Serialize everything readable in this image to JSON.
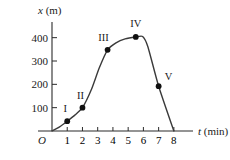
{
  "chart_data": {
    "type": "line",
    "title": "",
    "xlabel": "t (min)",
    "ylabel": "x (m)",
    "xlabel_var": "t",
    "xlabel_unit": "(min)",
    "ylabel_var": "x",
    "ylabel_unit": "(m)",
    "origin_label": "O",
    "grid": false,
    "legend": "none",
    "xlim": [
      0,
      8.6
    ],
    "ylim": [
      0,
      450
    ],
    "xticks": [
      1,
      2,
      3,
      4,
      5,
      6,
      7,
      8
    ],
    "xticklabels": [
      "1",
      "2",
      "3",
      "4",
      "5",
      "6",
      "7",
      "8"
    ],
    "yticks": [
      100,
      200,
      300,
      400
    ],
    "yticklabels": [
      "100",
      "200",
      "300",
      "400"
    ],
    "series": [
      {
        "name": "position",
        "x": [
          0,
          0.5,
          1,
          1.5,
          2,
          2.6,
          3.1,
          3.65,
          4.2,
          4.8,
          5.5,
          5.95,
          6.3,
          7,
          8
        ],
        "y": [
          0,
          18,
          42,
          68,
          100,
          180,
          270,
          348,
          378,
          395,
          403,
          405,
          360,
          192,
          0
        ]
      }
    ],
    "points": [
      {
        "label": "I",
        "t": 1,
        "x": 42,
        "label_dx": -2,
        "label_dy": -9
      },
      {
        "label": "II",
        "t": 2,
        "x": 100,
        "label_dx": -2,
        "label_dy": -9
      },
      {
        "label": "III",
        "t": 3.65,
        "x": 348,
        "label_dx": -4,
        "label_dy": -9
      },
      {
        "label": "IV",
        "t": 5.5,
        "x": 403,
        "label_dx": 0,
        "label_dy": -10
      },
      {
        "label": "V",
        "t": 7,
        "x": 192,
        "label_dx": 10,
        "label_dy": -6
      }
    ],
    "colors": {
      "curve": "#3a3a3a",
      "axis": "#2b2b2b",
      "dot": "#101010",
      "text": "#1a1a1a",
      "background": "#ffffff"
    }
  }
}
